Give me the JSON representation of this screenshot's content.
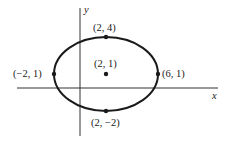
{
  "diagram": {
    "type": "ellipse",
    "axes": {
      "x_label": "x",
      "y_label": "y"
    },
    "center": {
      "label": "(2, 1)",
      "x": 2,
      "y": 1
    },
    "vertices": [
      {
        "id": "top",
        "label": "(2, 4)",
        "x": 2,
        "y": 4
      },
      {
        "id": "bottom",
        "label": "(2, −2)",
        "x": 2,
        "y": -2
      },
      {
        "id": "left",
        "label": "(−2, 1)",
        "x": -2,
        "y": 1
      },
      {
        "id": "right",
        "label": "(6, 1)",
        "x": 6,
        "y": 1
      }
    ],
    "colors": {
      "stroke": "#1a1a1a",
      "background": "#ffffff"
    }
  }
}
